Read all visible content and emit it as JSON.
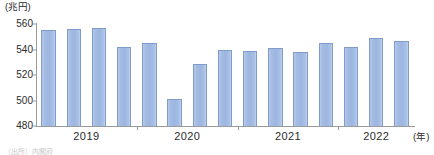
{
  "chart_data": {
    "type": "bar",
    "title": "",
    "subtitle": "",
    "unit_label": "(兆円)",
    "xlabel": "(年)",
    "ylabel": "",
    "ylim": [
      480,
      560
    ],
    "ytick_step": 20,
    "yticks": [
      560,
      540,
      520,
      500,
      480
    ],
    "ytick_labels": [
      "560",
      "540",
      "520",
      "500",
      "480"
    ],
    "grid": false,
    "legend": null,
    "categories": [
      "2019 Q1",
      "2019 Q2",
      "2019 Q3",
      "2019 Q4",
      "2020 Q1",
      "2020 Q2",
      "2020 Q3",
      "2020 Q4",
      "2021 Q1",
      "2021 Q2",
      "2021 Q3",
      "2021 Q4",
      "2022 Q1",
      "2022 Q2",
      "2022 Q3"
    ],
    "values": [
      555,
      556,
      557,
      542,
      545,
      501,
      529,
      540,
      539,
      541,
      538,
      545,
      542,
      549,
      547
    ],
    "x_group_labels": [
      "2019",
      "2020",
      "2021",
      "2022"
    ],
    "bar_color": "#9db6e0",
    "bar_border_color": "#7f9bc9",
    "axis_color": "#9a9a9a"
  },
  "source_note": "（出所）内閣府"
}
